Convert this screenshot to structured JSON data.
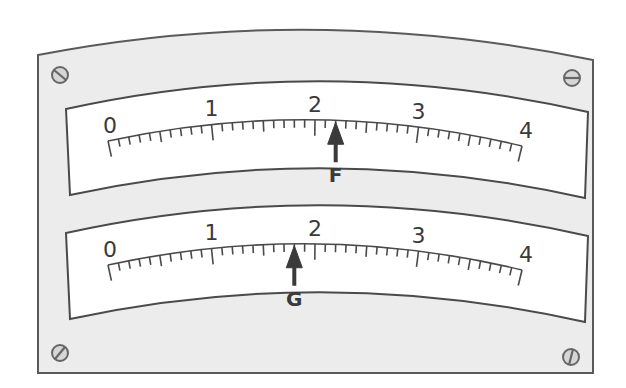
{
  "diagram": {
    "title": "",
    "type": "dual-scale meter panel",
    "colors": {
      "plate": "#ececec",
      "plate_border": "#5a5a5a",
      "window": "#ffffff",
      "ink": "#3a3a3a"
    },
    "scales": [
      {
        "id": "upper",
        "min": 0,
        "max": 4,
        "major_labels": [
          "0",
          "1",
          "2",
          "3",
          "4"
        ],
        "minor_step": 0.1,
        "pointer": {
          "label": "F",
          "value": 2.2
        }
      },
      {
        "id": "lower",
        "min": 0,
        "max": 4,
        "major_labels": [
          "0",
          "1",
          "2",
          "3",
          "4"
        ],
        "minor_step": 0.1,
        "pointer": {
          "label": "G",
          "value": 1.8
        }
      }
    ],
    "screws": [
      "top-left",
      "top-right",
      "bottom-left",
      "bottom-right"
    ]
  }
}
